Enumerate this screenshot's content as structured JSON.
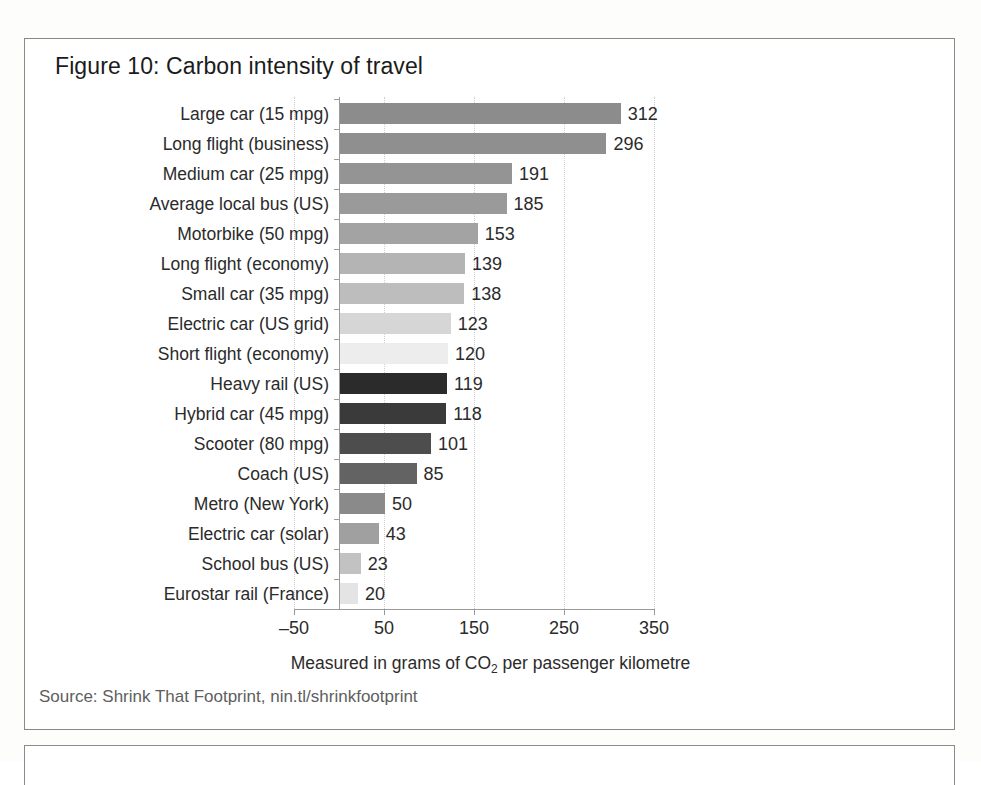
{
  "figure": {
    "title": "Figure 10: Carbon intensity of travel",
    "source": "Source: Shrink That Footprint, nin.tl/shrinkfootprint",
    "axis_caption_prefix": "Measured in grams of CO",
    "axis_caption_sub": "2",
    "axis_caption_suffix": " per passenger kilometre"
  },
  "chart_data": {
    "type": "bar",
    "orientation": "horizontal",
    "title": "Figure 10: Carbon intensity of travel",
    "xlabel": "Measured in grams of CO2 per passenger kilometre",
    "ylabel": "",
    "xlim": [
      -50,
      350
    ],
    "xticks": [
      -50,
      50,
      150,
      250,
      350
    ],
    "xtick_labels": [
      "–50",
      "50",
      "150",
      "250",
      "350"
    ],
    "grid": true,
    "legend": "none",
    "categories": [
      "Large car (15 mpg)",
      "Long flight (business)",
      "Medium car (25 mpg)",
      "Average local bus (US)",
      "Motorbike (50 mpg)",
      "Long flight (economy)",
      "Small car (35 mpg)",
      "Electric car (US grid)",
      "Short flight (economy)",
      "Heavy rail (US)",
      "Hybrid car (45 mpg)",
      "Scooter (80 mpg)",
      "Coach (US)",
      "Metro (New York)",
      "Electric car (solar)",
      "School bus (US)",
      "Eurostar rail (France)"
    ],
    "values": [
      312,
      296,
      191,
      185,
      153,
      139,
      138,
      123,
      120,
      119,
      118,
      101,
      85,
      50,
      43,
      23,
      20
    ],
    "bar_colors": [
      "#8c8c8c",
      "#8f8f8f",
      "#949494",
      "#9a9a9a",
      "#a3a3a3",
      "#b4b4b4",
      "#bdbdbd",
      "#d6d6d6",
      "#ededed",
      "#2b2b2b",
      "#3a3a3a",
      "#4d4d4d",
      "#636363",
      "#8a8a8a",
      "#a0a0a0",
      "#c2c2c2",
      "#e4e4e4"
    ]
  }
}
